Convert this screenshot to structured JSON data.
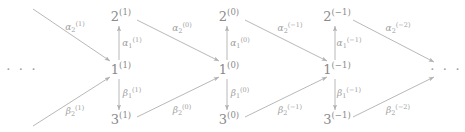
{
  "figure": {
    "type": "quiver-diagram",
    "stroke_color": "#b0b0b0",
    "text_color": "#8a8a8a",
    "background_color": "#ffffff"
  },
  "ellipses": [
    {
      "id": "left-ellipsis",
      "text": "· · ·",
      "x": 22,
      "y": 69
    },
    {
      "id": "right-ellipsis",
      "text": "· · ·",
      "x": 446,
      "y": 69
    }
  ],
  "nodes": [
    {
      "id": "n2-1",
      "base": "2",
      "sup": "(1)",
      "x": 121,
      "y": 16,
      "column": "1"
    },
    {
      "id": "n1-1",
      "base": "1",
      "sup": "(1)",
      "x": 121,
      "y": 69,
      "column": "1"
    },
    {
      "id": "n3-1",
      "base": "3",
      "sup": "(1)",
      "x": 121,
      "y": 119,
      "column": "1"
    },
    {
      "id": "n2-0",
      "base": "2",
      "sup": "(0)",
      "x": 229,
      "y": 16,
      "column": "0"
    },
    {
      "id": "n1-0",
      "base": "1",
      "sup": "(0)",
      "x": 229,
      "y": 69,
      "column": "0"
    },
    {
      "id": "n3-0",
      "base": "3",
      "sup": "(0)",
      "x": 229,
      "y": 119,
      "column": "0"
    },
    {
      "id": "n2-m1",
      "base": "2",
      "sup": "(−1)",
      "x": 337,
      "y": 16,
      "column": "-1"
    },
    {
      "id": "n1-m1",
      "base": "1",
      "sup": "(−1)",
      "x": 337,
      "y": 69,
      "column": "-1"
    },
    {
      "id": "n3-m1",
      "base": "3",
      "sup": "(−1)",
      "x": 337,
      "y": 119,
      "column": "-1"
    }
  ],
  "edges": [
    {
      "id": "alpha2-1",
      "kind": "diagonal-down-right",
      "from": {
        "x": 33,
        "y": 9
      },
      "to": {
        "x": 110,
        "y": 61
      },
      "label": {
        "greek": "α",
        "sub": "2",
        "sup": "(1)",
        "x": 75,
        "y": 27
      }
    },
    {
      "id": "beta2-1",
      "kind": "diagonal-up-right",
      "from": {
        "x": 33,
        "y": 126
      },
      "to": {
        "x": 110,
        "y": 77
      },
      "label": {
        "greek": "β",
        "sub": "2",
        "sup": "(1)",
        "x": 75,
        "y": 111
      }
    },
    {
      "id": "alpha1-1",
      "kind": "vertical-up",
      "from": {
        "x": 119,
        "y": 60
      },
      "to": {
        "x": 119,
        "y": 26
      },
      "label": {
        "greek": "α",
        "sub": "1",
        "sup": "(1)",
        "x": 132,
        "y": 43
      }
    },
    {
      "id": "beta1-1",
      "kind": "vertical-down",
      "from": {
        "x": 119,
        "y": 79
      },
      "to": {
        "x": 119,
        "y": 110
      },
      "label": {
        "greek": "β",
        "sub": "1",
        "sup": "(1)",
        "x": 132,
        "y": 93
      }
    },
    {
      "id": "alpha2-0",
      "kind": "diagonal-down-right",
      "from": {
        "x": 137,
        "y": 20
      },
      "to": {
        "x": 219,
        "y": 61
      },
      "label": {
        "greek": "α",
        "sub": "2",
        "sup": "(0)",
        "x": 182,
        "y": 28
      }
    },
    {
      "id": "beta2-0",
      "kind": "diagonal-up-right",
      "from": {
        "x": 137,
        "y": 117
      },
      "to": {
        "x": 219,
        "y": 77
      },
      "label": {
        "greek": "β",
        "sub": "2",
        "sup": "(0)",
        "x": 182,
        "y": 110
      }
    },
    {
      "id": "alpha1-0",
      "kind": "vertical-up",
      "from": {
        "x": 227,
        "y": 60
      },
      "to": {
        "x": 227,
        "y": 26
      },
      "label": {
        "greek": "α",
        "sub": "1",
        "sup": "(0)",
        "x": 240,
        "y": 43
      }
    },
    {
      "id": "beta1-0",
      "kind": "vertical-down",
      "from": {
        "x": 227,
        "y": 79
      },
      "to": {
        "x": 227,
        "y": 110
      },
      "label": {
        "greek": "β",
        "sub": "1",
        "sup": "(0)",
        "x": 240,
        "y": 93
      }
    },
    {
      "id": "alpha2-m1",
      "kind": "diagonal-down-right",
      "from": {
        "x": 245,
        "y": 20
      },
      "to": {
        "x": 327,
        "y": 61
      },
      "label": {
        "greek": "α",
        "sub": "2",
        "sup": "(−1)",
        "x": 290,
        "y": 28
      }
    },
    {
      "id": "beta2-m1",
      "kind": "diagonal-up-right",
      "from": {
        "x": 245,
        "y": 117
      },
      "to": {
        "x": 327,
        "y": 77
      },
      "label": {
        "greek": "β",
        "sub": "2",
        "sup": "(−1)",
        "x": 290,
        "y": 110
      }
    },
    {
      "id": "alpha1-m1",
      "kind": "vertical-up",
      "from": {
        "x": 335,
        "y": 60
      },
      "to": {
        "x": 335,
        "y": 26
      },
      "label": {
        "greek": "α",
        "sub": "1",
        "sup": "(−1)",
        "x": 349,
        "y": 43
      }
    },
    {
      "id": "beta1-m1",
      "kind": "vertical-down",
      "from": {
        "x": 335,
        "y": 79
      },
      "to": {
        "x": 335,
        "y": 110
      },
      "label": {
        "greek": "β",
        "sub": "1",
        "sup": "(−1)",
        "x": 349,
        "y": 93
      }
    },
    {
      "id": "alpha2-m2",
      "kind": "diagonal-down-right",
      "from": {
        "x": 353,
        "y": 20
      },
      "to": {
        "x": 434,
        "y": 62
      },
      "label": {
        "greek": "α",
        "sub": "2",
        "sup": "(−2)",
        "x": 398,
        "y": 28
      }
    },
    {
      "id": "beta2-m2",
      "kind": "diagonal-up-right",
      "from": {
        "x": 353,
        "y": 117
      },
      "to": {
        "x": 434,
        "y": 77
      },
      "label": {
        "greek": "β",
        "sub": "2",
        "sup": "(−2)",
        "x": 398,
        "y": 110
      }
    }
  ]
}
